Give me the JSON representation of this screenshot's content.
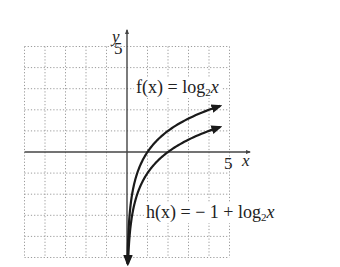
{
  "chart_data": {
    "type": "line",
    "title": "",
    "xlabel": "x",
    "ylabel": "y",
    "xlim": [
      -5,
      5
    ],
    "ylim": [
      -5,
      5
    ],
    "grid": true,
    "tick_labels": {
      "x": [
        "5"
      ],
      "y": [
        "5"
      ]
    },
    "series": [
      {
        "name": "f(x) = log2 x",
        "label_prefix": "f(x) = log",
        "label_sub": "2",
        "label_var": "x",
        "x": [
          0.03125,
          0.0625,
          0.125,
          0.25,
          0.5,
          1,
          2,
          3,
          4,
          5.5
        ],
        "values": [
          -5,
          -4,
          -3,
          -2,
          -1,
          0,
          1,
          1.585,
          2,
          2.46
        ]
      },
      {
        "name": "h(x) = -1 + log2 x",
        "label_prefix": "h(x) =  − 1 + log",
        "label_sub": "2",
        "label_var": "x",
        "x": [
          0.0625,
          0.125,
          0.25,
          0.5,
          1,
          2,
          3,
          4,
          5.5
        ],
        "values": [
          -5,
          -4,
          -3,
          -2,
          -1,
          0,
          0.585,
          1,
          1.46
        ]
      }
    ],
    "annotations": [
      "f(x) = log2 x",
      "h(x) = -1 + log2 x"
    ]
  },
  "labels": {
    "y_axis": "y",
    "x_axis": "x",
    "y_tick": "5",
    "x_tick": "5"
  },
  "colors": {
    "grid": "#9a9a9a",
    "axis": "#444444",
    "curve": "#1a1a1a"
  }
}
